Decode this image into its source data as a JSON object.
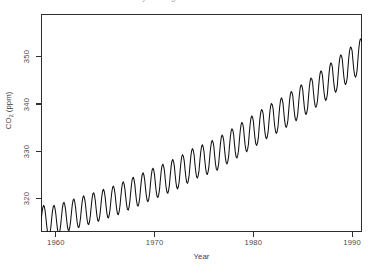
{
  "chart_data": {
    "type": "line",
    "title": "Monthly Average CO2 Concentration",
    "xlabel": "Year",
    "ylabel": "CO2 (ppm)",
    "ylabel_main": "CO",
    "ylabel_sub": "2",
    "ylabel_unit": " (ppm)",
    "xlim": [
      1958.5,
      1991.0
    ],
    "ylim": [
      313.0,
      359.0
    ],
    "xticks": [
      1960,
      1970,
      1980,
      1990
    ],
    "xtick_labels": [
      "1960",
      "1970",
      "1980",
      "1990"
    ],
    "yticks": [
      320,
      330,
      340,
      350
    ],
    "ytick_labels": [
      "320",
      "330",
      "340",
      "350"
    ],
    "grid": false,
    "legend": null,
    "line_color": "#111111",
    "frame_color": "#2e2e2e",
    "background": "#ffffff",
    "series": [
      {
        "name": "CO2 monthly mean",
        "description": "Mauna Loa monthly mean CO2, rising trend with seasonal sawtooth of about 6 ppm peak-to-peak; maximum in May, minimum in late September.",
        "trend_start_ppm": 315.5,
        "trend_end_ppm": 354.5,
        "seasonal_amplitude_ppm": 3.1,
        "seasonal_peak_month": 5,
        "seasonal_trough_month": 9.5,
        "x": [
          1958.5,
          1959.0,
          1959.5,
          1960.0,
          1960.5,
          1961.0,
          1961.5,
          1962.0,
          1962.5,
          1963.0,
          1963.5,
          1964.0,
          1964.5,
          1965.0,
          1965.5,
          1966.0,
          1966.5,
          1967.0,
          1967.5,
          1968.0,
          1968.5,
          1969.0,
          1969.5,
          1970.0,
          1970.5,
          1971.0,
          1971.5,
          1972.0,
          1972.5,
          1973.0,
          1973.5,
          1974.0,
          1974.5,
          1975.0,
          1975.5,
          1976.0,
          1976.5,
          1977.0,
          1977.5,
          1978.0,
          1978.5,
          1979.0,
          1979.5,
          1980.0,
          1980.5,
          1981.0,
          1981.5,
          1982.0,
          1982.5,
          1983.0,
          1983.5,
          1984.0,
          1984.5,
          1985.0,
          1985.5,
          1986.0,
          1986.5,
          1987.0,
          1987.5,
          1988.0,
          1988.5,
          1989.0,
          1989.5,
          1990.0,
          1990.5,
          1991.0
        ],
        "y": [
          315.3,
          315.9,
          314.1,
          316.8,
          314.6,
          317.5,
          315.3,
          318.2,
          315.9,
          318.9,
          316.5,
          319.6,
          317.2,
          320.3,
          317.9,
          321.0,
          318.6,
          322.0,
          319.5,
          323.0,
          320.3,
          324.0,
          321.2,
          325.0,
          322.0,
          325.9,
          322.9,
          326.9,
          323.8,
          328.0,
          325.0,
          329.3,
          326.0,
          330.0,
          326.8,
          331.0,
          327.6,
          332.3,
          329.0,
          333.6,
          330.2,
          335.0,
          331.5,
          336.4,
          332.8,
          337.8,
          334.2,
          339.0,
          335.3,
          340.2,
          336.6,
          341.6,
          338.0,
          343.0,
          339.3,
          344.5,
          340.8,
          346.0,
          342.2,
          347.8,
          343.9,
          349.5,
          345.5,
          351.2,
          347.0,
          353.0
        ]
      }
    ]
  },
  "axes": {
    "xlabel": "Year",
    "ylabel_main": "CO",
    "ylabel_sub": "2",
    "ylabel_unit": " (ppm)"
  }
}
